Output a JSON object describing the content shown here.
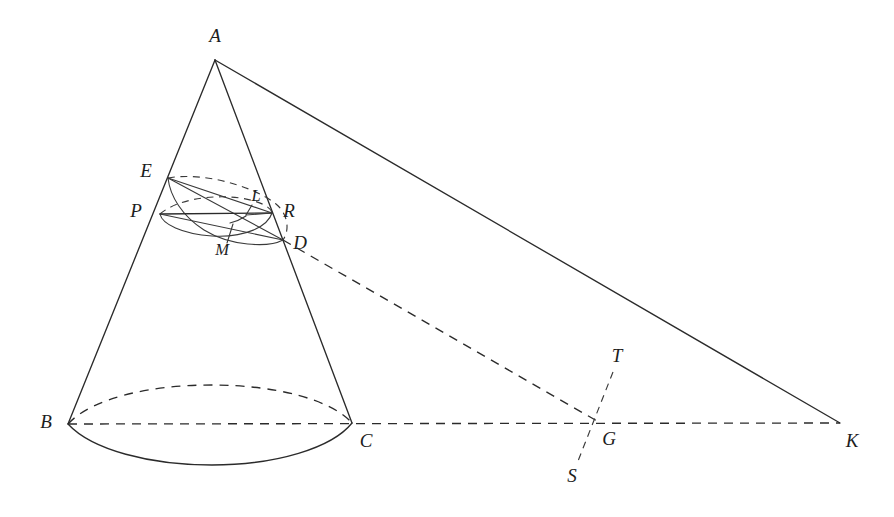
{
  "figure": {
    "kind": "geometry-diagram",
    "canvas": {
      "width": 894,
      "height": 517
    },
    "stroke_color": "#2b2b2b",
    "label_color": "#1d1d1d",
    "background": "#ffffff"
  },
  "labels": {
    "A": "A",
    "B": "B",
    "C": "C",
    "D": "D",
    "E": "E",
    "G": "G",
    "K": "K",
    "L": "L",
    "M": "M",
    "P": "P",
    "R": "R",
    "S": "S",
    "T": "T"
  },
  "points": {
    "A": {
      "x": 215,
      "y": 60,
      "label_x": 215,
      "label_y": 38
    },
    "B": {
      "x": 68,
      "y": 424,
      "label_x": 46,
      "label_y": 424
    },
    "C": {
      "x": 352,
      "y": 423,
      "label_x": 366,
      "label_y": 443
    },
    "D": {
      "x": 283,
      "y": 240,
      "label_x": 300,
      "label_y": 245
    },
    "E": {
      "x": 168,
      "y": 178,
      "label_x": 146,
      "label_y": 173
    },
    "G": {
      "x": 597,
      "y": 421,
      "label_x": 609,
      "label_y": 441
    },
    "K": {
      "x": 840,
      "y": 423,
      "label_x": 852,
      "label_y": 443
    },
    "L": {
      "x": 246,
      "y": 215,
      "label_x": 256,
      "label_y": 197
    },
    "M": {
      "x": 230,
      "y": 223,
      "label_x": 222,
      "label_y": 251
    },
    "P": {
      "x": 160,
      "y": 214,
      "label_x": 136,
      "label_y": 213
    },
    "R": {
      "x": 272,
      "y": 213,
      "label_x": 289,
      "label_y": 213
    },
    "S": {
      "x": 578,
      "y": 461,
      "label_x": 572,
      "label_y": 478
    },
    "T": {
      "x": 613,
      "y": 372,
      "label_x": 617,
      "label_y": 358
    }
  },
  "elements": {
    "cone_left_edge": "A-B generator of the cone",
    "cone_right_edge": "A-C generator of the cone passing through R and D",
    "tangent_line": "A-K tangent line from apex to directrix point K",
    "base_front_arc": "solid front half of base circle B-C",
    "base_back_arc": "dashed rear half of base circle B-C",
    "base_diameter": "dashed line B-C-G-K",
    "section_ellipse": "ellipse E-D cutting plane through the cone",
    "sphere_circle": "circle of contact P-R of inscribed sphere",
    "axis_ED": "solid major axis segment E-D",
    "chord_PR": "solid horizontal chord P-R",
    "line_DG": "dashed line from D through to G",
    "directrix_TS": "dashed directrix line T-S through G"
  }
}
